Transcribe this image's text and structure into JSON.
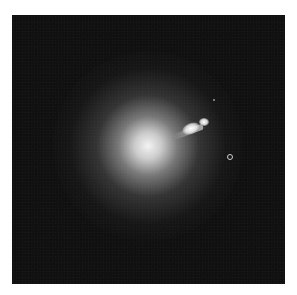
{
  "image": {
    "subject": "galaxy with jet",
    "background_color": "#111111",
    "frame_color": "#ffffff",
    "features": [
      {
        "name": "galaxy-core",
        "x": 148,
        "y": 146
      },
      {
        "name": "jet-knot-1",
        "x": 190,
        "y": 130
      },
      {
        "name": "jet-knot-2",
        "x": 205,
        "y": 122
      },
      {
        "name": "ring-object",
        "x": 229,
        "y": 156
      },
      {
        "name": "faint-dot",
        "x": 213,
        "y": 99
      }
    ]
  }
}
